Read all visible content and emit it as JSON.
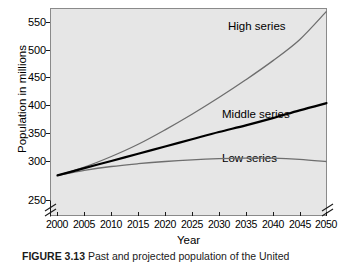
{
  "figure": {
    "caption_label": "FIGURE 3.13",
    "caption_text": "Past and projected population of the United"
  },
  "chart_data": {
    "type": "line",
    "title": "",
    "xlabel": "Year",
    "ylabel": "Population in millions",
    "xlim": [
      2000,
      2050
    ],
    "ylim": [
      250,
      575
    ],
    "grid": false,
    "axis_break_y": true,
    "axis_break_x": true,
    "legend_position": "inline-annotations",
    "x": [
      2000,
      2005,
      2010,
      2015,
      2020,
      2025,
      2030,
      2035,
      2040,
      2045,
      2050
    ],
    "xticks": [
      "2000",
      "2005",
      "2010",
      "2015",
      "2020",
      "2025",
      "2030",
      "2035",
      "2040",
      "2045",
      "2050"
    ],
    "yticks": [
      "250",
      "300",
      "350",
      "400",
      "450",
      "500",
      "550"
    ],
    "ytick_values": [
      250,
      300,
      350,
      400,
      450,
      500,
      550
    ],
    "series": [
      {
        "name": "High series",
        "color": "#6e6e6e",
        "width": 1.3,
        "values": [
          275,
          290,
          309,
          331,
          357,
          385,
          415,
          447,
          481,
          519,
          570
        ]
      },
      {
        "name": "Middle series",
        "color": "#000000",
        "width": 2.2,
        "values": [
          275,
          288,
          301,
          314,
          327,
          340,
          353,
          365,
          378,
          392,
          405
        ]
      },
      {
        "name": "Low series",
        "color": "#6e6e6e",
        "width": 1.3,
        "values": [
          275,
          284,
          291,
          296,
          300,
          303,
          305,
          306,
          306,
          304,
          300
        ]
      }
    ],
    "annotations": [
      {
        "text": "High series",
        "x": 2033,
        "y": 545
      },
      {
        "text": "Middle series",
        "x": 2031,
        "y": 368
      },
      {
        "text": "Low series",
        "x": 2031,
        "y": 320
      }
    ]
  }
}
